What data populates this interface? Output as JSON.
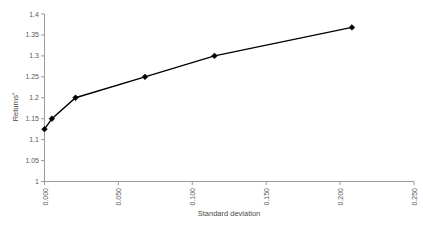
{
  "chart_data": {
    "type": "line",
    "title": "",
    "xlabel": "Standard deviation",
    "ylabel": "Returns*",
    "xlim": [
      0.0,
      0.25
    ],
    "ylim": [
      1.0,
      1.4
    ],
    "grid": false,
    "legend": "none",
    "marker": "diamond",
    "line_color": "#000000",
    "axis_color": "#9a9a9a",
    "background": "#ffffff",
    "x_tick_labels": [
      "0.000",
      "0.050",
      "0.100",
      "0.150",
      "0.200",
      "0.250"
    ],
    "x_tick_values": [
      0.0,
      0.05,
      0.1,
      0.15,
      0.2,
      0.25
    ],
    "x_tick_rotation": -90,
    "y_tick_labels": [
      "1",
      "1.05",
      "1.1",
      "1.15",
      "1.2",
      "1.25",
      "1.3",
      "1.35",
      "1.4"
    ],
    "y_tick_values": [
      1.0,
      1.05,
      1.1,
      1.15,
      1.2,
      1.25,
      1.3,
      1.35,
      1.4
    ],
    "series": [
      {
        "name": "Efficient frontier",
        "x": [
          0.0,
          0.005,
          0.021,
          0.068,
          0.115,
          0.208
        ],
        "y": [
          1.125,
          1.15,
          1.2,
          1.25,
          1.3,
          1.368
        ]
      }
    ]
  },
  "axis_titles": {
    "x": "Standard deviation",
    "y_main": "Returns",
    "y_superscript": "*"
  }
}
